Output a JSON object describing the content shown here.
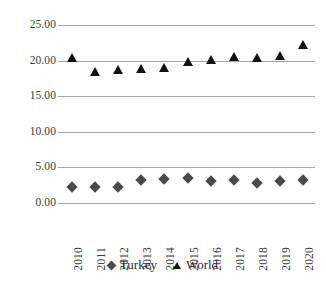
{
  "chart_data": {
    "type": "scatter",
    "title": "",
    "subtitle": "",
    "xlabel": "",
    "ylabel": "",
    "categories": [
      "2010",
      "2011",
      "2012",
      "2013",
      "2014",
      "2015",
      "2016",
      "2017",
      "2018",
      "2019",
      "2020"
    ],
    "series": [
      {
        "name": "Turkey",
        "marker": "diamond",
        "color": "#4a4a4a",
        "values": [
          2.3,
          2.2,
          2.2,
          3.2,
          3.4,
          3.5,
          3.1,
          3.3,
          2.8,
          3.1,
          3.2
        ]
      },
      {
        "name": "World",
        "marker": "triangle",
        "color": "#111111",
        "values": [
          20.4,
          18.4,
          18.7,
          18.8,
          18.9,
          19.8,
          20.1,
          20.5,
          20.4,
          20.7,
          22.2
        ]
      }
    ],
    "ylim": [
      0,
      25
    ],
    "yticks": [
      0,
      5,
      10,
      15,
      20,
      25
    ],
    "ytick_labels": [
      "0.00",
      "5.00",
      "10.00",
      "15.00",
      "20.00",
      "25.00"
    ],
    "grid": true,
    "grid_axis": "y",
    "grid_color": "#a6a6a6",
    "legend": true,
    "legend_position": "bottom",
    "legend_entries": [
      {
        "label": "Turkey",
        "marker": "diamond"
      },
      {
        "label": "World",
        "marker": "triangle"
      }
    ]
  }
}
